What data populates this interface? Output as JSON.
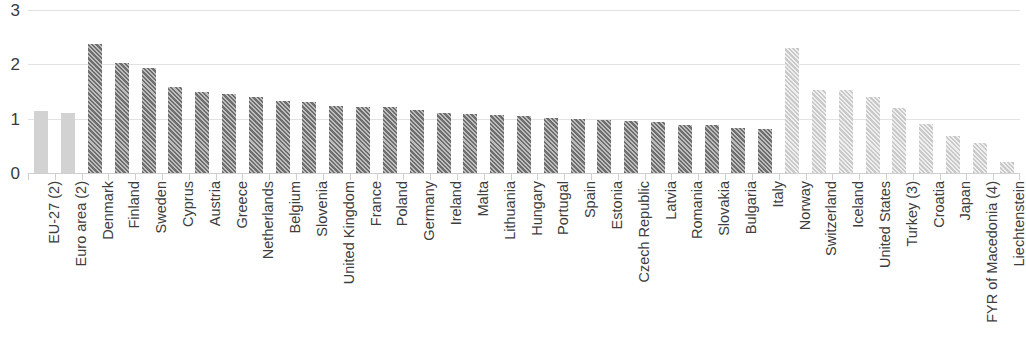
{
  "chart_data": {
    "type": "bar",
    "title": "",
    "subtitle": "",
    "xlabel": "",
    "ylabel": "",
    "ylim": [
      0,
      3
    ],
    "ytick_labels": [
      "0",
      "1",
      "2",
      "3"
    ],
    "ytick_values": [
      0,
      1,
      2,
      3
    ],
    "grid": true,
    "legend": false,
    "legend_position": "none",
    "orientation": "vertical",
    "categories": [
      "EU-27 (2)",
      "Euro area (2)",
      "Denmark",
      "Finland",
      "Sweden",
      "Cyprus",
      "Austria",
      "Greece",
      "Netherlands",
      "Belgium",
      "Slovenia",
      "United Kingdom",
      "France",
      "Poland",
      "Germany",
      "Ireland",
      "Malta",
      "Lithuania",
      "Hungary",
      "Portugal",
      "Spain",
      "Estonia",
      "Czech Republic",
      "Latvia",
      "Romania",
      "Slovakia",
      "Bulgaria",
      "Italy",
      "Norway",
      "Switzerland",
      "Iceland",
      "United States",
      "Turkey (3)",
      "Croatia",
      "Japan",
      "FYR of Macedonia (4)",
      "Liechtenstein"
    ],
    "values": [
      1.15,
      1.11,
      2.37,
      2.02,
      1.93,
      1.59,
      1.5,
      1.45,
      1.4,
      1.32,
      1.3,
      1.23,
      1.21,
      1.21,
      1.16,
      1.1,
      1.08,
      1.07,
      1.05,
      1.01,
      0.99,
      0.97,
      0.95,
      0.94,
      0.89,
      0.88,
      0.82,
      0.81,
      2.3,
      1.53,
      1.52,
      1.39,
      1.2,
      0.9,
      0.68,
      0.56,
      0.2
    ],
    "bar_styles": [
      "solid-light",
      "solid-light",
      "hatch-dark",
      "hatch-dark",
      "hatch-dark",
      "hatch-dark",
      "hatch-dark",
      "hatch-dark",
      "hatch-dark",
      "hatch-dark",
      "hatch-dark",
      "hatch-dark",
      "hatch-dark",
      "hatch-dark",
      "hatch-dark",
      "hatch-dark",
      "hatch-dark",
      "hatch-dark",
      "hatch-dark",
      "hatch-dark",
      "hatch-dark",
      "hatch-dark",
      "hatch-dark",
      "hatch-dark",
      "hatch-dark",
      "hatch-dark",
      "hatch-dark",
      "hatch-dark",
      "hatch-light",
      "hatch-light",
      "hatch-light",
      "hatch-light",
      "hatch-light",
      "hatch-light",
      "hatch-light",
      "hatch-light",
      "hatch-light"
    ]
  },
  "colors": {
    "aggregate_bar": "#d2d2d2",
    "eu_member_bar": "#6e6e6e",
    "non_eu_bar": "#c9c9c9",
    "gridline": "#e2e2e2",
    "axis": "#cfcfcf",
    "text": "#3d3d3d",
    "background": "#ffffff"
  }
}
